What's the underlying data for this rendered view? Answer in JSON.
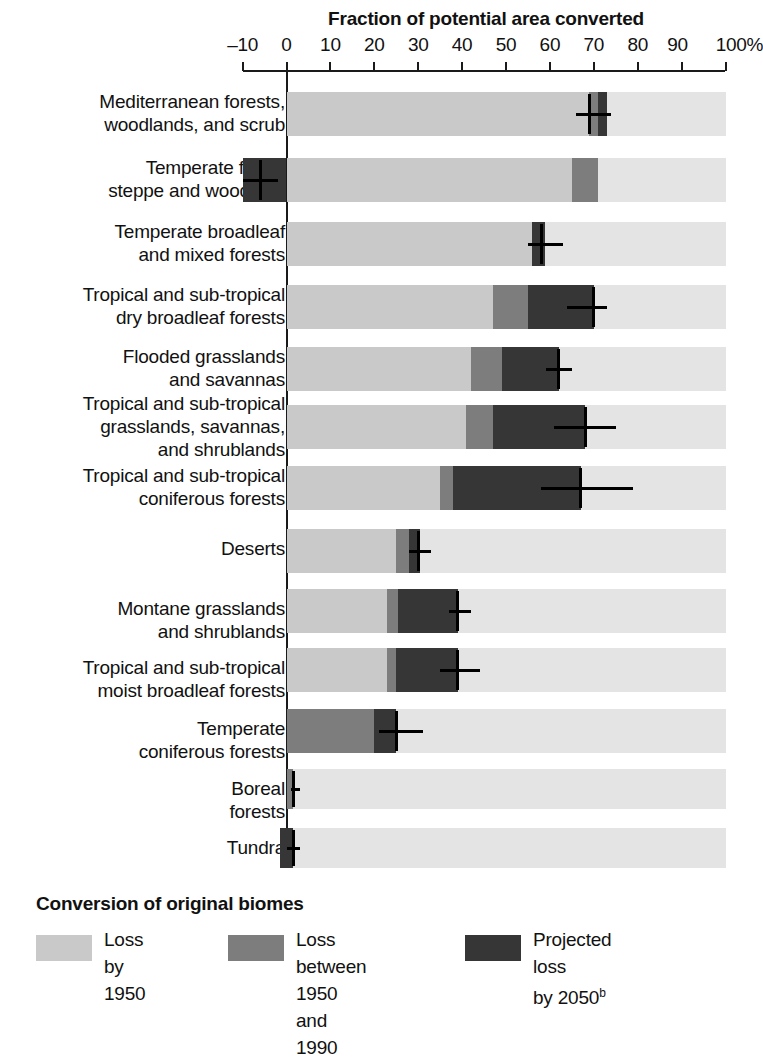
{
  "chart_data": {
    "type": "bar",
    "orientation": "horizontal",
    "stacked": true,
    "title": "Fraction of potential area converted",
    "xlabel": "",
    "ylabel": "",
    "xlim": [
      -10,
      100
    ],
    "xticks": [
      -10,
      0,
      10,
      20,
      30,
      40,
      50,
      60,
      70,
      80,
      90,
      100
    ],
    "xticklabels": [
      "–10",
      "0",
      "10",
      "20",
      "30",
      "40",
      "50",
      "60",
      "70",
      "80",
      "90",
      "100%"
    ],
    "grid": false,
    "legend_title": "Conversion of original biomes",
    "legend_position": "bottom",
    "series": [
      {
        "name": "Loss by 1950",
        "color": "#c9c9c9"
      },
      {
        "name": "Loss between 1950 and 1990",
        "color": "#7d7d7d"
      },
      {
        "name": "Projected loss by 2050",
        "color": "#363636"
      }
    ],
    "track_color": "#e4e4e4",
    "categories": [
      "Mediterranean forests,\nwoodlands, and scrub",
      "Temperate forest\nsteppe and woodland",
      "Temperate broadleaf\nand mixed forests",
      "Tropical and sub-tropical\ndry broadleaf forests",
      "Flooded grasslands\nand savannas",
      "Tropical and sub-tropical\ngrasslands, savannas,\nand shrublands",
      "Tropical and sub-tropical\nconiferous forests",
      "Deserts",
      "Montane grasslands\nand shrublands",
      "Tropical and sub-tropical\nmoist broadleaf forests",
      "Temperate\nconiferous forests",
      "Boreal\nforests",
      "Tundra"
    ],
    "rows": [
      {
        "category": "Mediterranean forests, woodlands, and scrub",
        "loss_by_1950": 69,
        "loss_1950_1990": 2,
        "projected_loss_2050": 2,
        "total_2050": 73,
        "marker": 69,
        "marker_span": [
          66,
          74
        ]
      },
      {
        "category": "Temperate forest steppe and woodland",
        "loss_by_1950": 65,
        "loss_1950_1990": 6,
        "projected_loss_2050": 0,
        "total_2050": 71,
        "marker": -6,
        "marker_span": [
          -10,
          -2
        ],
        "negative_projected": [
          -10,
          0
        ]
      },
      {
        "category": "Temperate broadleaf and mixed forests",
        "loss_by_1950": 56,
        "loss_1950_1990": 0,
        "projected_loss_2050": 3,
        "total_2050": 59,
        "marker": 58,
        "marker_span": [
          55,
          63
        ]
      },
      {
        "category": "Tropical and sub-tropical dry broadleaf forests",
        "loss_by_1950": 47,
        "loss_1950_1990": 8,
        "projected_loss_2050": 15,
        "total_2050": 70,
        "marker": 70,
        "marker_span": [
          64,
          73
        ]
      },
      {
        "category": "Flooded grasslands and savannas",
        "loss_by_1950": 42,
        "loss_1950_1990": 7,
        "projected_loss_2050": 13,
        "total_2050": 62,
        "marker": 62,
        "marker_span": [
          59,
          65
        ]
      },
      {
        "category": "Tropical and sub-tropical grasslands, savannas, and shrublands",
        "loss_by_1950": 41,
        "loss_1950_1990": 6,
        "projected_loss_2050": 21,
        "total_2050": 68,
        "marker": 68,
        "marker_span": [
          61,
          75
        ]
      },
      {
        "category": "Tropical and sub-tropical coniferous forests",
        "loss_by_1950": 35,
        "loss_1950_1990": 3,
        "projected_loss_2050": 29,
        "total_2050": 67,
        "marker": 67,
        "marker_span": [
          58,
          79
        ]
      },
      {
        "category": "Deserts",
        "loss_by_1950": 25,
        "loss_1950_1990": 3,
        "projected_loss_2050": 2.5,
        "total_2050": 30.5,
        "marker": 30,
        "marker_span": [
          28,
          33
        ]
      },
      {
        "category": "Montane grasslands and shrublands",
        "loss_by_1950": 23,
        "loss_1950_1990": 2.5,
        "projected_loss_2050": 13.5,
        "total_2050": 39,
        "marker": 39,
        "marker_span": [
          37,
          42
        ]
      },
      {
        "category": "Tropical and sub-tropical moist broadleaf forests",
        "loss_by_1950": 23,
        "loss_1950_1990": 2,
        "projected_loss_2050": 14,
        "total_2050": 39,
        "marker": 39,
        "marker_span": [
          35,
          44
        ]
      },
      {
        "category": "Temperate coniferous forests",
        "loss_by_1950": 0,
        "loss_1950_1990": 20,
        "projected_loss_2050": 5,
        "total_2050": 25,
        "marker": 25,
        "marker_span": [
          21,
          31
        ]
      },
      {
        "category": "Boreal forests",
        "loss_by_1950": 0,
        "loss_1950_1990": 1.5,
        "projected_loss_2050": 0,
        "total_2050": 1.5,
        "marker": 1.5,
        "marker_span": [
          1,
          3
        ]
      },
      {
        "category": "Tundra",
        "loss_by_1950": 0,
        "loss_1950_1990": 0,
        "projected_loss_2050": 1.5,
        "total_2050": 1.5,
        "marker": 1.5,
        "marker_span": [
          0,
          3
        ],
        "negative_projected": [
          -1.5,
          1.5
        ]
      }
    ]
  },
  "legend": {
    "title": "Conversion of original biomes",
    "items": [
      {
        "label": "Loss by\n1950",
        "color": "#c9c9c9"
      },
      {
        "label": "Loss between\n1950 and 1990",
        "color": "#7d7d7d"
      },
      {
        "label": "Projected loss\nby 2050",
        "color": "#363636",
        "superscript": "b"
      }
    ]
  }
}
